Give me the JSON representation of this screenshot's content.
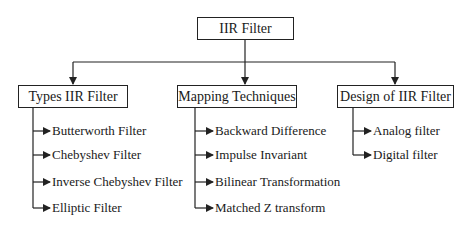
{
  "root": {
    "label": "IIR Filter"
  },
  "branches": [
    {
      "label": "Types IIR Filter",
      "items": [
        "Butterworth Filter",
        "Chebyshev Filter",
        "Inverse Chebyshev Filter",
        "Elliptic Filter"
      ]
    },
    {
      "label": "Mapping Techniques",
      "items": [
        "Backward Difference",
        "Impulse Invariant",
        "Bilinear Transformation",
        "Matched Z transform"
      ]
    },
    {
      "label": "Design of IIR Filter",
      "items": [
        "Analog filter",
        "Digital filter"
      ]
    }
  ],
  "colors": {
    "line": "#222222",
    "text": "#1a1a1a",
    "background": "#ffffff"
  }
}
